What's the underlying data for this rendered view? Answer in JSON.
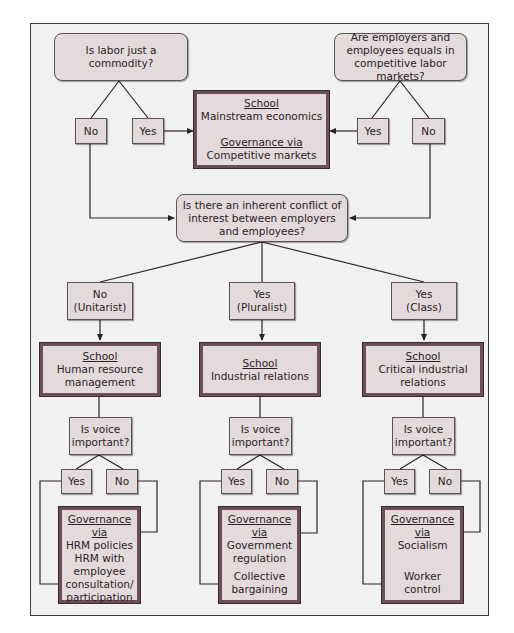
{
  "diagram": {
    "colors": {
      "box_fill": "#e3dadc",
      "school_border": "#6b4e56",
      "background": "#f2f1f1",
      "line": "#2a2326"
    },
    "top_left": {
      "question": "Is labor just a commodity?",
      "no": "No",
      "yes": "Yes"
    },
    "top_right": {
      "question": "Are employers and employees equals in competitive labor markets?",
      "yes": "Yes",
      "no": "No"
    },
    "mainstream": {
      "school_label": "School",
      "school": "Mainstream economics",
      "governance_label": "Governance via",
      "governance": "Competitive markets"
    },
    "central_question": "Is there an inherent conflict of interest between employers and employees?",
    "branches": [
      {
        "answer_line1": "No",
        "answer_line2": "(Unitarist)",
        "school_label": "School",
        "school": "Human resource management",
        "voice_question": "Is voice important?",
        "yes": "Yes",
        "no": "No",
        "governance_label": "Governance via",
        "governance_no": "HRM policies",
        "governance_yes": "HRM with employee consultation/ participation"
      },
      {
        "answer_line1": "Yes",
        "answer_line2": "(Pluralist)",
        "school_label": "School",
        "school": "Industrial relations",
        "voice_question": "Is voice important?",
        "yes": "Yes",
        "no": "No",
        "governance_label": "Governance via",
        "governance_no": "Government regulation",
        "governance_yes": "Collective bargaining"
      },
      {
        "answer_line1": "Yes",
        "answer_line2": "(Class)",
        "school_label": "School",
        "school": "Critical industrial relations",
        "voice_question": "Is voice important?",
        "yes": "Yes",
        "no": "No",
        "governance_label": "Governance via",
        "governance_no": "Socialism",
        "governance_yes": "Worker control"
      }
    ]
  }
}
